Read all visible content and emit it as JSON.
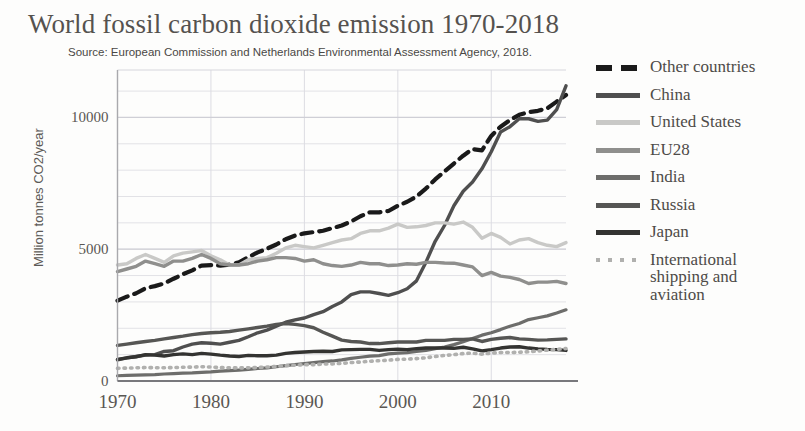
{
  "chart_data": {
    "type": "line",
    "title": "World fossil carbon dioxide emission 1970-2018",
    "subtitle": "Source: European Commission and Netherlands Environmental Assessment Agency, 2018.",
    "xlabel": "",
    "ylabel": "Million tonnes CO2/year",
    "xlim": [
      1970,
      2018
    ],
    "ylim": [
      0,
      11800
    ],
    "yticks": [
      0,
      5000,
      10000
    ],
    "ytick_labels": [
      "0",
      "5000",
      "10000"
    ],
    "xticks": [
      1970,
      1980,
      1990,
      2000,
      2010
    ],
    "xtick_labels": [
      "1970",
      "1980",
      "1990",
      "2000",
      "2010"
    ],
    "grid": true,
    "grid_minor_step": 1000,
    "legend_position": "right",
    "x": [
      1970,
      1971,
      1972,
      1973,
      1974,
      1975,
      1976,
      1977,
      1978,
      1979,
      1980,
      1981,
      1982,
      1983,
      1984,
      1985,
      1986,
      1987,
      1988,
      1989,
      1990,
      1991,
      1992,
      1993,
      1994,
      1995,
      1996,
      1997,
      1998,
      1999,
      2000,
      2001,
      2002,
      2003,
      2004,
      2005,
      2006,
      2007,
      2008,
      2009,
      2010,
      2011,
      2012,
      2013,
      2014,
      2015,
      2016,
      2017,
      2018
    ],
    "series": [
      {
        "name": "Other countries",
        "color": "#1a1a1a",
        "style": "dashed",
        "width": 4.2,
        "values": [
          3050,
          3200,
          3330,
          3520,
          3600,
          3700,
          3880,
          4050,
          4200,
          4380,
          4400,
          4380,
          4420,
          4500,
          4700,
          4880,
          5020,
          5180,
          5380,
          5520,
          5600,
          5650,
          5700,
          5800,
          5900,
          6050,
          6250,
          6400,
          6400,
          6450,
          6650,
          6800,
          7000,
          7300,
          7650,
          7950,
          8250,
          8550,
          8800,
          8750,
          9300,
          9650,
          9900,
          10100,
          10200,
          10250,
          10350,
          10600,
          10850
        ]
      },
      {
        "name": "China",
        "color": "#4f4f4f",
        "style": "solid",
        "width": 3.4,
        "values": [
          800,
          880,
          930,
          980,
          1000,
          1120,
          1150,
          1290,
          1400,
          1450,
          1430,
          1400,
          1470,
          1540,
          1680,
          1830,
          1930,
          2080,
          2230,
          2320,
          2390,
          2520,
          2630,
          2830,
          3000,
          3280,
          3380,
          3380,
          3320,
          3250,
          3350,
          3500,
          3800,
          4500,
          5300,
          5900,
          6650,
          7200,
          7550,
          8050,
          8700,
          9450,
          9650,
          9950,
          9950,
          9850,
          9900,
          10300,
          11200
        ]
      },
      {
        "name": "United States",
        "color": "#c9c9c7",
        "style": "solid",
        "width": 3.4,
        "values": [
          4400,
          4450,
          4650,
          4800,
          4650,
          4500,
          4750,
          4850,
          4900,
          4950,
          4750,
          4600,
          4400,
          4400,
          4600,
          4650,
          4680,
          4850,
          5050,
          5150,
          5100,
          5050,
          5150,
          5250,
          5350,
          5400,
          5600,
          5700,
          5700,
          5800,
          5950,
          5830,
          5850,
          5900,
          6000,
          6000,
          5950,
          6030,
          5830,
          5420,
          5600,
          5450,
          5200,
          5350,
          5400,
          5250,
          5150,
          5100,
          5250
        ]
      },
      {
        "name": "EU28",
        "color": "#8f8f8d",
        "style": "solid",
        "width": 3.4,
        "values": [
          4150,
          4250,
          4350,
          4550,
          4450,
          4350,
          4550,
          4550,
          4650,
          4800,
          4650,
          4450,
          4400,
          4400,
          4450,
          4550,
          4600,
          4680,
          4680,
          4650,
          4550,
          4600,
          4450,
          4380,
          4350,
          4400,
          4500,
          4450,
          4450,
          4380,
          4400,
          4450,
          4430,
          4500,
          4500,
          4480,
          4470,
          4400,
          4330,
          4000,
          4120,
          3980,
          3930,
          3850,
          3700,
          3750,
          3750,
          3780,
          3700
        ]
      },
      {
        "name": "India",
        "color": "#6d6d6b",
        "style": "solid",
        "width": 3.2,
        "values": [
          200,
          215,
          225,
          235,
          245,
          265,
          280,
          300,
          310,
          330,
          345,
          375,
          395,
          415,
          440,
          475,
          500,
          540,
          580,
          625,
          660,
          700,
          735,
          760,
          800,
          860,
          900,
          945,
          965,
          1030,
          1060,
          1080,
          1120,
          1160,
          1230,
          1290,
          1380,
          1490,
          1610,
          1740,
          1830,
          1950,
          2080,
          2180,
          2330,
          2400,
          2470,
          2580,
          2700
        ]
      },
      {
        "name": "Russia",
        "color": "#565654",
        "style": "solid",
        "width": 3.4,
        "values": [
          1350,
          1400,
          1450,
          1500,
          1540,
          1600,
          1650,
          1700,
          1760,
          1800,
          1830,
          1850,
          1880,
          1930,
          1980,
          2030,
          2080,
          2150,
          2180,
          2150,
          2100,
          2020,
          1850,
          1700,
          1550,
          1500,
          1480,
          1420,
          1420,
          1450,
          1480,
          1480,
          1480,
          1540,
          1540,
          1540,
          1580,
          1580,
          1600,
          1500,
          1580,
          1620,
          1650,
          1600,
          1580,
          1550,
          1560,
          1580,
          1600
        ]
      },
      {
        "name": "Japan",
        "color": "#333331",
        "style": "solid",
        "width": 3.4,
        "values": [
          820,
          880,
          920,
          1000,
          980,
          950,
          1000,
          1030,
          1000,
          1050,
          1020,
          980,
          950,
          930,
          970,
          960,
          960,
          980,
          1050,
          1080,
          1100,
          1120,
          1130,
          1120,
          1180,
          1190,
          1200,
          1200,
          1160,
          1190,
          1210,
          1190,
          1230,
          1250,
          1250,
          1250,
          1240,
          1280,
          1220,
          1140,
          1190,
          1250,
          1290,
          1300,
          1250,
          1220,
          1200,
          1190,
          1160
        ]
      },
      {
        "name": "International shipping and aviation",
        "color": "#b0b0ae",
        "style": "dotted",
        "width": 3.6,
        "values": [
          480,
          490,
          500,
          510,
          505,
          500,
          510,
          520,
          530,
          540,
          530,
          510,
          500,
          495,
          505,
          510,
          530,
          550,
          580,
          600,
          620,
          620,
          640,
          650,
          670,
          700,
          720,
          750,
          770,
          790,
          820,
          830,
          850,
          880,
          930,
          970,
          1000,
          1040,
          1060,
          1020,
          1060,
          1080,
          1080,
          1090,
          1110,
          1140,
          1170,
          1200,
          1230
        ]
      }
    ]
  },
  "legend": {
    "items": [
      {
        "label": "Other countries"
      },
      {
        "label": "China"
      },
      {
        "label": "United States"
      },
      {
        "label": "EU28"
      },
      {
        "label": "India"
      },
      {
        "label": "Russia"
      },
      {
        "label": "Japan"
      },
      {
        "label": "International shipping and aviation"
      }
    ]
  }
}
